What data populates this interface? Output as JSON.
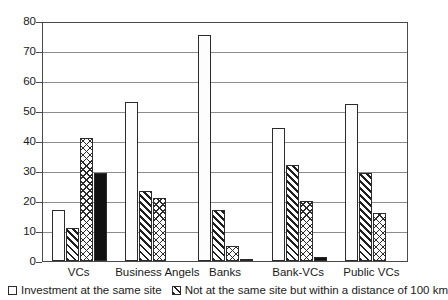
{
  "chart_data": {
    "type": "bar",
    "title": "",
    "xlabel": "",
    "ylabel": "",
    "ylim": [
      0,
      80
    ],
    "yticks": [
      0,
      10,
      20,
      30,
      40,
      50,
      60,
      70,
      80
    ],
    "grid": true,
    "legend_position": "bottom",
    "categories": [
      "VCs",
      "Business Angels",
      "Banks",
      "Bank-VCs",
      "Public VCs"
    ],
    "series": [
      {
        "name": "Investment at the same site",
        "pattern": "stipple",
        "values": [
          17,
          53,
          75.5,
          44.5,
          52.5
        ]
      },
      {
        "name": "Not at the same site but within a distance of 100 km",
        "pattern": "diagonal-hatch",
        "values": [
          11,
          23.5,
          17,
          32,
          29.5
        ]
      },
      {
        "name": "",
        "pattern": "cross-hatch",
        "values": [
          41,
          21,
          5,
          20,
          16
        ]
      },
      {
        "name": "",
        "pattern": "solid-black",
        "values": [
          29.5,
          0,
          0.5,
          1.5,
          0
        ]
      }
    ]
  },
  "legend": {
    "items": [
      {
        "label": "Investment at the same site",
        "swatch": "stipple"
      },
      {
        "label": "Not at the same site but within a distance of 100 km",
        "swatch": "diagonal-hatch"
      }
    ]
  },
  "colors": {
    "axis": "#4a4a4a",
    "gridline": "#8c8c8c",
    "bar_outline": "#2b2b2b",
    "solid_bar": "#111111",
    "text": "#1a1a1a",
    "background": "#ffffff"
  }
}
